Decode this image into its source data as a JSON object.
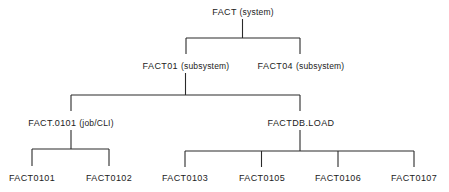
{
  "diagram": {
    "type": "hierarchy-tree",
    "line_color": "#2a2a2a",
    "text_color": "#222222",
    "background": "#ffffff",
    "root": {
      "name": "FACT",
      "qualifier": "(system)"
    },
    "level1": [
      {
        "name": "FACT01",
        "qualifier": "(subsystem)"
      },
      {
        "name": "FACT04",
        "qualifier": "(subsystem)"
      }
    ],
    "level2": [
      {
        "name": "FACT.0101",
        "qualifier": "(job/CLI)",
        "parent": "FACT01"
      },
      {
        "name": "FACTDB.LOAD",
        "qualifier": "",
        "parent": "FACT01"
      }
    ],
    "leaves": [
      {
        "name": "FACT0101",
        "parent": "FACT.0101"
      },
      {
        "name": "FACT0102",
        "parent": "FACT.0101"
      },
      {
        "name": "FACT0103",
        "parent": "FACTDB.LOAD"
      },
      {
        "name": "FACT0105",
        "parent": "FACTDB.LOAD"
      },
      {
        "name": "FACT0106",
        "parent": "FACTDB.LOAD"
      },
      {
        "name": "FACT0107",
        "parent": "FACTDB.LOAD"
      }
    ]
  }
}
